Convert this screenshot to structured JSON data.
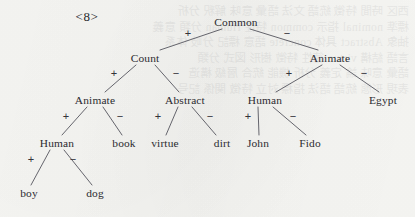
{
  "figure": {
    "caption": "<8>",
    "caption_x": 87,
    "caption_y": 17,
    "background_color": "#f7f7f4",
    "ink_color": "#2b2b30",
    "line_color": "#55555d",
    "width": 415,
    "height": 217
  },
  "bleed_through_text": "西区 時間 特徵 統語 文法 語彙 意味 解釈 分析\n標準 nominal 指示 common 特性 Human 分類 意義\n抽象 Abstract 具体 concrete 語意 標記 分岐 体系\n言語 結構 virtue 徳性 特徵 樹形 図式 分類\n語彙 意味 論 定義 分析 機能 統合 層級 構造\n表現 形態 統語 語法 指標 対立 特徴 関係 記号",
  "tree": {
    "type": "binary-feature-tree",
    "nodes": [
      {
        "id": "common",
        "label": "Common",
        "x": 236,
        "y": 22,
        "level": 0,
        "is_leaf": false
      },
      {
        "id": "count",
        "label": "Count",
        "x": 145,
        "y": 58,
        "level": 1,
        "is_leaf": false
      },
      {
        "id": "animate_r",
        "label": "Animate",
        "x": 330,
        "y": 58,
        "level": 1,
        "is_leaf": false
      },
      {
        "id": "animate_l",
        "label": "Animate",
        "x": 95,
        "y": 100,
        "level": 2,
        "is_leaf": false
      },
      {
        "id": "abstract",
        "label": "Abstract",
        "x": 185,
        "y": 100,
        "level": 2,
        "is_leaf": false
      },
      {
        "id": "human_r",
        "label": "Human",
        "x": 265,
        "y": 100,
        "level": 2,
        "is_leaf": false
      },
      {
        "id": "egypt",
        "label": "Egypt",
        "x": 383,
        "y": 100,
        "level": 2,
        "is_leaf": true
      },
      {
        "id": "human_l",
        "label": "Human",
        "x": 57,
        "y": 143,
        "level": 3,
        "is_leaf": false
      },
      {
        "id": "book",
        "label": "book",
        "x": 124,
        "y": 143,
        "level": 3,
        "is_leaf": true
      },
      {
        "id": "virtue",
        "label": "virtue",
        "x": 165,
        "y": 143,
        "level": 3,
        "is_leaf": true
      },
      {
        "id": "dirt",
        "label": "dirt",
        "x": 222,
        "y": 143,
        "level": 3,
        "is_leaf": true
      },
      {
        "id": "john",
        "label": "John",
        "x": 258,
        "y": 143,
        "level": 3,
        "is_leaf": true
      },
      {
        "id": "fido",
        "label": "Fido",
        "x": 310,
        "y": 143,
        "level": 3,
        "is_leaf": true
      },
      {
        "id": "boy",
        "label": "boy",
        "x": 29,
        "y": 193,
        "level": 4,
        "is_leaf": true
      },
      {
        "id": "dog",
        "label": "dog",
        "x": 95,
        "y": 193,
        "level": 4,
        "is_leaf": true
      }
    ],
    "edges": [
      {
        "from": "common",
        "to": "count",
        "sign": "+",
        "x1": 222,
        "y1": 29,
        "x2": 160,
        "y2": 50,
        "label_x": 188,
        "label_y": 33
      },
      {
        "from": "common",
        "to": "animate_r",
        "sign": "−",
        "x1": 250,
        "y1": 29,
        "x2": 318,
        "y2": 50,
        "label_x": 287,
        "label_y": 33
      },
      {
        "from": "count",
        "to": "animate_l",
        "sign": "+",
        "x1": 136,
        "y1": 65,
        "x2": 105,
        "y2": 92,
        "label_x": 114,
        "label_y": 73
      },
      {
        "from": "count",
        "to": "abstract",
        "sign": "−",
        "x1": 155,
        "y1": 65,
        "x2": 179,
        "y2": 92,
        "label_x": 176,
        "label_y": 73
      },
      {
        "from": "animate_r",
        "to": "human_r",
        "sign": "+",
        "x1": 322,
        "y1": 65,
        "x2": 276,
        "y2": 92,
        "label_x": 289,
        "label_y": 73
      },
      {
        "from": "animate_r",
        "to": "egypt",
        "sign": "−",
        "x1": 340,
        "y1": 65,
        "x2": 379,
        "y2": 92,
        "label_x": 364,
        "label_y": 73
      },
      {
        "from": "animate_l",
        "to": "human_l",
        "sign": "+",
        "x1": 87,
        "y1": 107,
        "x2": 62,
        "y2": 135,
        "label_x": 66,
        "label_y": 116
      },
      {
        "from": "animate_l",
        "to": "book",
        "sign": "−",
        "x1": 103,
        "y1": 107,
        "x2": 122,
        "y2": 135,
        "label_x": 120,
        "label_y": 116
      },
      {
        "from": "abstract",
        "to": "virtue",
        "sign": "+",
        "x1": 178,
        "y1": 107,
        "x2": 166,
        "y2": 135,
        "label_x": 158,
        "label_y": 116
      },
      {
        "from": "abstract",
        "to": "dirt",
        "sign": "−",
        "x1": 192,
        "y1": 107,
        "x2": 216,
        "y2": 135,
        "label_x": 210,
        "label_y": 116
      },
      {
        "from": "human_r",
        "to": "john",
        "sign": "+",
        "x1": 258,
        "y1": 107,
        "x2": 259,
        "y2": 135,
        "label_x": 248,
        "label_y": 116
      },
      {
        "from": "human_r",
        "to": "fido",
        "sign": "−",
        "x1": 273,
        "y1": 107,
        "x2": 306,
        "y2": 135,
        "label_x": 293,
        "label_y": 116
      },
      {
        "from": "human_l",
        "to": "boy",
        "sign": "+",
        "x1": 50,
        "y1": 150,
        "x2": 31,
        "y2": 185,
        "label_x": 31,
        "label_y": 159
      },
      {
        "from": "human_l",
        "to": "dog",
        "sign": "−",
        "x1": 64,
        "y1": 150,
        "x2": 92,
        "y2": 185,
        "label_x": 73,
        "label_y": 159
      }
    ]
  }
}
